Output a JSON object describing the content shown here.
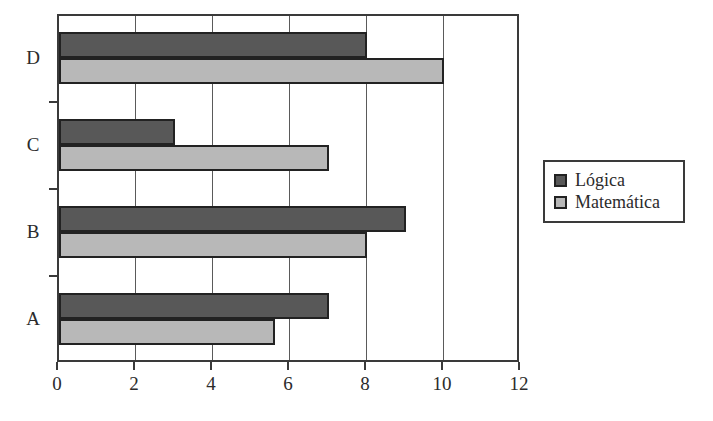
{
  "chart_data": {
    "type": "bar",
    "orientation": "horizontal",
    "title": "",
    "subtitle": "",
    "xlabel": "",
    "ylabel": "",
    "categories": [
      "D",
      "C",
      "B",
      "A"
    ],
    "series": [
      {
        "name": "Lógica",
        "color": "#585858",
        "values": [
          8,
          3,
          9,
          7
        ]
      },
      {
        "name": "Matemática",
        "color": "#b8b8b8",
        "values": [
          10,
          7,
          8,
          5.6
        ]
      }
    ],
    "xlim": [
      0,
      12
    ],
    "xticks": [
      0,
      2,
      4,
      6,
      8,
      10,
      12
    ],
    "xtick_labels": [
      "0",
      "2",
      "4",
      "6",
      "8",
      "10",
      "12"
    ],
    "grid": true,
    "grid_axis": "x",
    "legend": {
      "position": "right",
      "entries": [
        {
          "label": "Lógica",
          "color": "#585858"
        },
        {
          "label": "Matemática",
          "color": "#b8b8b8"
        }
      ]
    },
    "background_color": "#ffffff",
    "axis_color": "#3a3a3a"
  }
}
